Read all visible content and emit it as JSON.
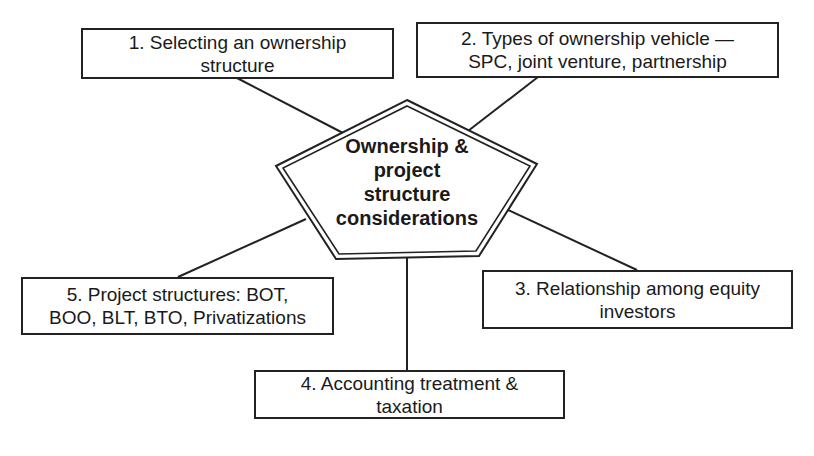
{
  "diagram": {
    "center": {
      "lines": [
        "Ownership &",
        "project",
        "structure",
        "considerations"
      ]
    },
    "nodes": [
      {
        "id": 1,
        "line1": "1. Selecting an ownership",
        "line2": "structure"
      },
      {
        "id": 2,
        "line1": "2. Types of ownership vehicle —",
        "line2": "SPC, joint venture, partnership"
      },
      {
        "id": 3,
        "line1": "3. Relationship among equity",
        "line2": "investors"
      },
      {
        "id": 4,
        "line1": "4. Accounting treatment &",
        "line2": "taxation"
      },
      {
        "id": 5,
        "line1": "5. Project structures: BOT,",
        "line2": "BOO, BLT, BTO, Privatizations"
      }
    ],
    "colors": {
      "stroke": "#222222",
      "text": "#1a1a1a",
      "background": "#ffffff"
    }
  }
}
